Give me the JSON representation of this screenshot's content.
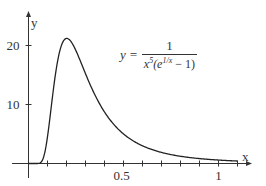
{
  "chart_data": {
    "type": "line",
    "title": "",
    "formula": {
      "lhs": "y =",
      "numerator": "1",
      "denominator_base": "x",
      "denominator_pow": "5",
      "denominator_rest_open": "(e",
      "denominator_exp": "1/x",
      "denominator_rest_close": " − 1)"
    },
    "xlabel": "x",
    "ylabel": "y",
    "x_ticks": [
      {
        "value": 0.5,
        "label": "0.5"
      },
      {
        "value": 1,
        "label": "1"
      }
    ],
    "y_ticks": [
      {
        "value": 10,
        "label": "10"
      },
      {
        "value": 20,
        "label": "20"
      }
    ],
    "xlim": [
      0,
      1.15
    ],
    "ylim": [
      0,
      24
    ],
    "x_minor_tick_step": 0.1,
    "grid": false,
    "series": [
      {
        "name": "y = 1/(x^5(e^(1/x) - 1))",
        "x": [
          0.05,
          0.1,
          0.15,
          0.2,
          0.25,
          0.3,
          0.4,
          0.5,
          0.6,
          0.7,
          0.8,
          0.9,
          1.0,
          1.1
        ],
        "y": [
          0.0,
          0.45,
          16.3,
          21.2,
          18.7,
          15.2,
          10.0,
          6.8,
          4.8,
          3.5,
          2.6,
          2.0,
          1.6,
          1.3
        ]
      }
    ],
    "x_range_plotted": [
      0.05,
      1.1
    ]
  }
}
